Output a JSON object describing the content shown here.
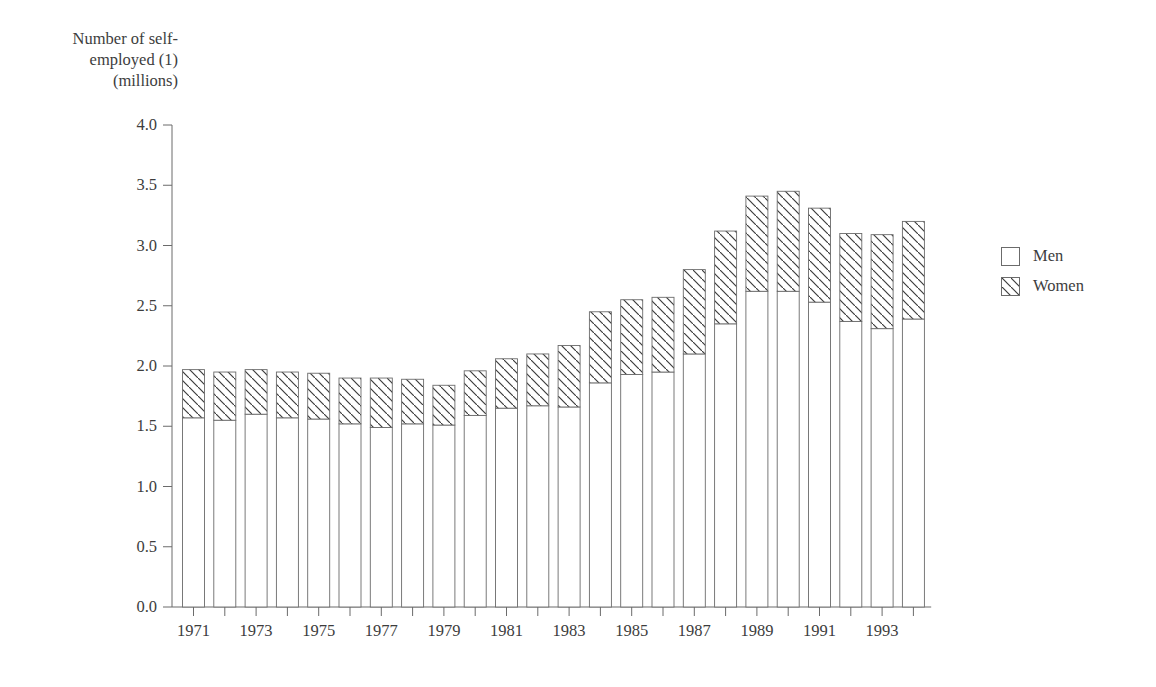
{
  "chart_data": {
    "type": "bar",
    "stacked": true,
    "title": "",
    "ylabel": "Number of self-employed (1) (millions)",
    "xlabel": "",
    "ylim": [
      0.0,
      4.0
    ],
    "ytick_labels": [
      "0.0",
      "0.5",
      "1.0",
      "1.5",
      "2.0",
      "2.5",
      "3.0",
      "3.5",
      "4.0"
    ],
    "ytick_values": [
      0.0,
      0.5,
      1.0,
      1.5,
      2.0,
      2.5,
      3.0,
      3.5,
      4.0
    ],
    "grid": false,
    "legend_position": "right",
    "categories": [
      1971,
      1972,
      1973,
      1974,
      1975,
      1976,
      1977,
      1978,
      1979,
      1980,
      1981,
      1982,
      1983,
      1984,
      1985,
      1986,
      1987,
      1988,
      1989,
      1990,
      1991,
      1992,
      1993,
      1994
    ],
    "xtick_labels_shown": [
      "1971",
      "1973",
      "1975",
      "1977",
      "1979",
      "1981",
      "1983",
      "1985",
      "1987",
      "1989",
      "1991",
      "1993"
    ],
    "series": [
      {
        "name": "Men",
        "hatch": "none",
        "values": [
          1.57,
          1.55,
          1.6,
          1.57,
          1.56,
          1.52,
          1.49,
          1.52,
          1.51,
          1.59,
          1.65,
          1.67,
          1.66,
          1.86,
          1.93,
          1.95,
          2.1,
          2.35,
          2.62,
          2.62,
          2.53,
          2.37,
          2.31,
          2.39
        ]
      },
      {
        "name": "Women",
        "hatch": "diagonal",
        "values": [
          0.4,
          0.4,
          0.37,
          0.38,
          0.38,
          0.38,
          0.41,
          0.37,
          0.33,
          0.37,
          0.41,
          0.43,
          0.51,
          0.59,
          0.62,
          0.62,
          0.7,
          0.77,
          0.79,
          0.83,
          0.78,
          0.73,
          0.78,
          0.81
        ]
      }
    ],
    "totals": [
      1.97,
      1.95,
      1.97,
      1.95,
      1.94,
      1.9,
      1.9,
      1.89,
      1.84,
      1.96,
      2.06,
      2.1,
      2.17,
      2.45,
      2.55,
      2.57,
      2.8,
      3.12,
      3.41,
      3.45,
      3.31,
      3.1,
      3.09,
      3.2
    ],
    "colors": {
      "men_fill": "#ffffff",
      "women_fill": "#ffffff",
      "outline": "#6b6b6b",
      "hatch": "#3a3a3a",
      "text": "#3d3d3d"
    }
  },
  "legend": {
    "items": [
      {
        "label": "Men"
      },
      {
        "label": "Women"
      }
    ]
  }
}
